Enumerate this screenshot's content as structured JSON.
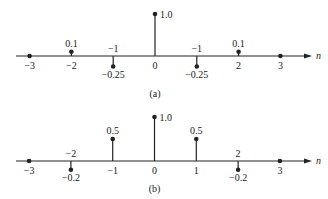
{
  "chart_data": [
    {
      "type": "stem",
      "caption": "(a)",
      "xlabel": "n",
      "x": [
        -3,
        -2,
        -1,
        0,
        1,
        2,
        3
      ],
      "values": [
        0,
        0.1,
        -0.25,
        1.0,
        -0.25,
        0.1,
        0
      ],
      "tick_labels": [
        "−3",
        "−2",
        "−1",
        "0",
        "−1",
        "2",
        "3"
      ],
      "value_labels": [
        "",
        "0.1",
        "−0.25",
        "1.0",
        "−0.25",
        "0.1",
        ""
      ],
      "grid": false
    },
    {
      "type": "stem",
      "caption": "(b)",
      "xlabel": "n",
      "x": [
        -3,
        -2,
        -1,
        0,
        1,
        2,
        3
      ],
      "values": [
        0,
        -0.2,
        0.5,
        1.0,
        0.5,
        -0.2,
        0
      ],
      "tick_labels": [
        "−3",
        "−2",
        "−1",
        "0",
        "1",
        "2",
        "3"
      ],
      "value_labels": [
        "",
        "−0.2",
        "0.5",
        "1.0",
        "0.5",
        "−0.2",
        ""
      ],
      "grid": false
    }
  ],
  "colors": {
    "ink": "#222222",
    "background": "#ffffff"
  }
}
